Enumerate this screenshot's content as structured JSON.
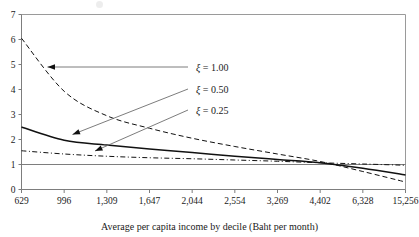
{
  "figure": {
    "background": "#ffffff",
    "ink": "#111111"
  },
  "axis": {
    "x_title": "Average per capita income by decile (Baht per month)",
    "y_title": "",
    "y_ticks": [
      "0",
      "1",
      "2",
      "3",
      "4",
      "5",
      "6",
      "7"
    ],
    "x_ticks": [
      "629",
      "996",
      "1,309",
      "1,647",
      "2,044",
      "2,554",
      "3,269",
      "4,402",
      "6,328",
      "15,256"
    ]
  },
  "annotations": [
    {
      "label_prefix": "ξ",
      "label_value": " = 1.00",
      "name": "series-label-xi-1-00"
    },
    {
      "label_prefix": "ξ",
      "label_value": " = 0.50",
      "name": "series-label-xi-0-50"
    },
    {
      "label_prefix": "ξ",
      "label_value": " = 0.25",
      "name": "series-label-xi-0-25"
    }
  ],
  "chart_data": {
    "type": "line",
    "title": "",
    "xlabel": "Average per capita income by decile (Baht per month)",
    "ylabel": "",
    "grid": false,
    "legend_position": "inline-annotations-with-leader-arrows",
    "ylim": [
      0,
      7
    ],
    "yticks": [
      0,
      1,
      2,
      3,
      4,
      5,
      6,
      7
    ],
    "x_categories": [
      "629",
      "996",
      "1,309",
      "1,647",
      "2,044",
      "2,554",
      "3,269",
      "4,402",
      "6,328",
      "15,256"
    ],
    "x_is_categorical": true,
    "reference_lines": [
      {
        "name": "unity-reference-line",
        "orientation": "horizontal",
        "y": 1.0
      }
    ],
    "series": [
      {
        "name": "ξ = 1.00",
        "xi": 1.0,
        "style": "dashed",
        "values": [
          6.05,
          3.93,
          2.95,
          2.45,
          2.05,
          1.72,
          1.42,
          1.12,
          0.72,
          0.3
        ]
      },
      {
        "name": "ξ = 0.50",
        "xi": 0.5,
        "style": "solid",
        "values": [
          2.5,
          1.97,
          1.78,
          1.62,
          1.48,
          1.33,
          1.2,
          1.07,
          0.85,
          0.58
        ]
      },
      {
        "name": "ξ = 0.25",
        "xi": 0.25,
        "style": "dash-dot",
        "values": [
          1.55,
          1.42,
          1.33,
          1.27,
          1.23,
          1.18,
          1.13,
          1.07,
          1.02,
          0.97
        ]
      }
    ]
  }
}
